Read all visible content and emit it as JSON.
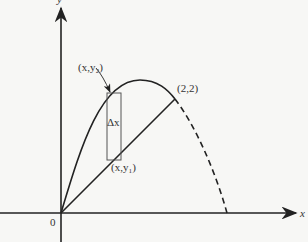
{
  "diagram": {
    "axes": {
      "x_label": "x",
      "y_label": "y",
      "origin_label": "0"
    },
    "labels": {
      "upper_point": "(x,y₂)",
      "lower_point": "(x,y₁)",
      "intersection": "(2,2)",
      "strip_width": "Δx"
    },
    "colors": {
      "stroke": "#222222",
      "strip": "#555555"
    }
  }
}
